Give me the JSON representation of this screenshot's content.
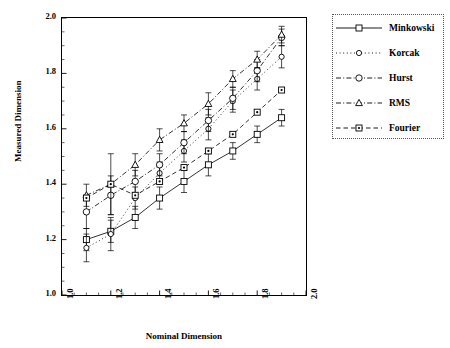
{
  "chart_data": {
    "type": "line",
    "title": "",
    "xlabel": "Nominal Dimension",
    "ylabel": "Measured Dimension",
    "xlim": [
      1.0,
      2.0
    ],
    "ylim": [
      1.0,
      2.0
    ],
    "xticks": [
      "1.0",
      "1.2",
      "1.4",
      "1.6",
      "1.8",
      "2.0"
    ],
    "yticks": [
      "1.0",
      "1.2",
      "1.4",
      "1.6",
      "1.8",
      "2.0"
    ],
    "grid": false,
    "legend_position": "right-outside",
    "x": [
      1.1,
      1.2,
      1.3,
      1.4,
      1.5,
      1.6,
      1.7,
      1.8,
      1.9
    ],
    "series": [
      {
        "name": "Minkowski",
        "marker": "square",
        "line": "solid",
        "values": [
          1.2,
          1.23,
          1.28,
          1.35,
          1.41,
          1.47,
          1.52,
          1.58,
          1.64
        ],
        "errors": [
          0.04,
          0.04,
          0.04,
          0.04,
          0.04,
          0.04,
          0.03,
          0.03,
          0.03
        ]
      },
      {
        "name": "Korcak",
        "marker": "circle-small",
        "line": "dotted",
        "values": [
          1.17,
          1.22,
          1.35,
          1.44,
          1.52,
          1.6,
          1.7,
          1.78,
          1.86
        ],
        "errors": [
          0.05,
          0.06,
          0.04,
          0.04,
          0.04,
          0.04,
          0.04,
          0.04,
          0.04
        ]
      },
      {
        "name": "Hurst",
        "marker": "circle",
        "line": "dash-dot",
        "values": [
          1.3,
          1.36,
          1.41,
          1.47,
          1.55,
          1.63,
          1.71,
          1.81,
          1.93
        ],
        "errors": [
          0.06,
          0.07,
          0.04,
          0.04,
          0.04,
          0.04,
          0.04,
          0.04,
          0.03
        ]
      },
      {
        "name": "RMS",
        "marker": "triangle",
        "line": "dash-dot",
        "values": [
          1.36,
          1.4,
          1.47,
          1.56,
          1.62,
          1.69,
          1.78,
          1.85,
          1.94
        ],
        "errors": [
          0.04,
          0.11,
          0.04,
          0.04,
          0.03,
          0.04,
          0.03,
          0.03,
          0.03
        ]
      },
      {
        "name": "Fourier",
        "marker": "square-dot",
        "line": "dashed",
        "values": [
          1.35,
          1.4,
          1.36,
          1.41,
          1.46,
          1.52,
          1.58,
          1.66,
          1.74
        ]
      }
    ]
  },
  "legend": {
    "items": [
      {
        "label": "Minkowski"
      },
      {
        "label": "Korcak"
      },
      {
        "label": "Hurst"
      },
      {
        "label": "RMS"
      },
      {
        "label": "Fourier"
      }
    ]
  }
}
